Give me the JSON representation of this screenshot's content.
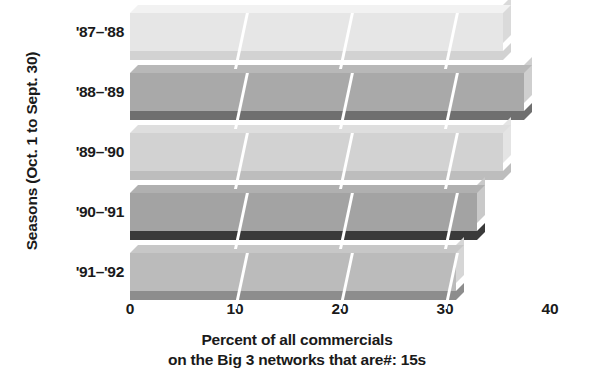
{
  "chart_data": {
    "type": "bar",
    "orientation": "horizontal",
    "title": "",
    "subtitle": "",
    "categories": [
      "'87–'88",
      "'88–'89",
      "'89–'90",
      "'90–'91",
      "'91–'92"
    ],
    "values": [
      35.5,
      37.5,
      35.5,
      33.0,
      31.0
    ],
    "series": [
      {
        "name": "Percent of all commercials that are :15s",
        "values": [
          35.5,
          37.5,
          35.5,
          33.0,
          31.0
        ]
      }
    ],
    "xlabel": "Percent of all commercials on the Big 3 networks that are#: 15s",
    "xlabel_lines": [
      "Percent of all commercials",
      "on the Big 3 networks that are#: 15s"
    ],
    "ylabel": "Seasons (Oct. 1 to Sept. 30)",
    "xticks": [
      "0",
      "10",
      "20",
      "30",
      "40"
    ],
    "xtick_values": [
      0,
      10,
      20,
      30,
      40
    ],
    "xlim": [
      0,
      40
    ],
    "grid": true,
    "gridline_values": [
      10,
      20,
      30
    ],
    "legend": null,
    "legend_position": "none",
    "style": "3d-horizontal-bars",
    "bar_colors": [
      {
        "front": "#e6e6e6",
        "top": "#f2f2f2",
        "side": "#dadada",
        "shadow": "#d2d2d2"
      },
      {
        "front": "#a9a9a9",
        "top": "#b8b8b8",
        "side": "#cfcfcf",
        "shadow": "#6f6f6f"
      },
      {
        "front": "#d2d2d2",
        "top": "#dedede",
        "side": "#e4e4e4",
        "shadow": "#bdbdbd"
      },
      {
        "front": "#a3a3a3",
        "top": "#b0b0b0",
        "side": "#c9c9c9",
        "shadow": "#3a3a3a"
      },
      {
        "front": "#bbbbbb",
        "top": "#c7c7c7",
        "side": "#d6d6d6",
        "shadow": "#8d8d8d"
      }
    ],
    "background_color": "#ffffff",
    "text_color": "#1a1a1a"
  },
  "axis": {
    "y_title": "Seasons (Oct. 1 to Sept. 30)",
    "x_title_line1": "Percent of all commercials",
    "x_title_line2": "on the Big 3 networks that are#: 15s"
  },
  "categories": {
    "c0": "'87–'88",
    "c1": "'88–'89",
    "c2": "'89–'90",
    "c3": "'90–'91",
    "c4": "'91–'92"
  },
  "xticks": {
    "t0": "0",
    "t1": "10",
    "t2": "20",
    "t3": "30",
    "t4": "40"
  }
}
